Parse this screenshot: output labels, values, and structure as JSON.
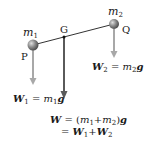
{
  "diagram": {
    "points": {
      "P": "P",
      "Q": "Q",
      "G": "G"
    },
    "masses": {
      "m1": {
        "symbol": "m",
        "sub": "1"
      },
      "m2": {
        "symbol": "m",
        "sub": "2"
      }
    },
    "forces": {
      "W1": {
        "lhs": "W",
        "lhs_sub": "1",
        "eq": " = ",
        "rhs_m": "m",
        "rhs_sub": "1",
        "rhs_g": "g"
      },
      "W2": {
        "lhs": "W",
        "lhs_sub": "2",
        "eq": " = ",
        "rhs_m": "m",
        "rhs_sub": "2",
        "rhs_g": "g"
      },
      "W": {
        "line1": {
          "lhs": "W",
          "eq": " = ",
          "open": "(",
          "m": "m",
          "sub1": "1",
          "plus": "+",
          "m2": "m",
          "sub2": "2",
          "close": ")",
          "g": "g"
        },
        "line2": {
          "eq": "= ",
          "W": "W",
          "sub1": "1",
          "plus": "+",
          "W2": "W",
          "sub2": "2"
        }
      }
    },
    "colors": {
      "rod": "#333333",
      "ball": "#808080",
      "light_arrow": "#a0a0a0",
      "dark_arrow": "#555555"
    }
  }
}
